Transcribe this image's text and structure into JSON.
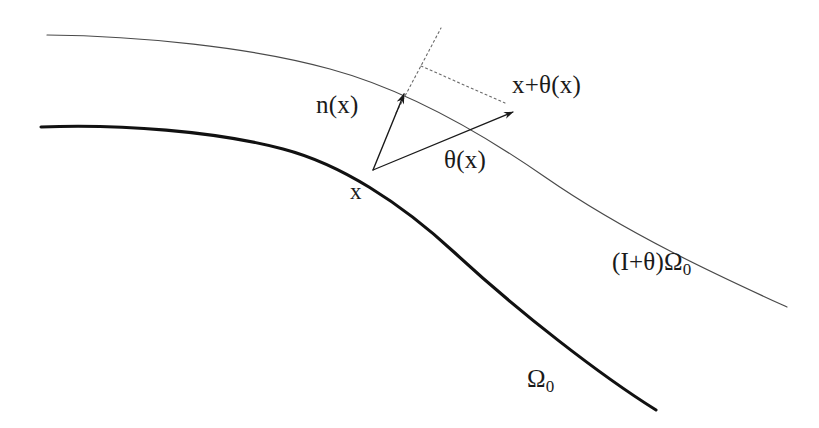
{
  "figure": {
    "background_color": "#ffffff",
    "width": 819,
    "height": 428,
    "ink_color": "#1a1a1a",
    "thin_curve_color": "#4a4a4a",
    "thick_curve_color": "#111111"
  },
  "labels": {
    "normal_vector": "n(x)",
    "displacement_vector": "θ(x)",
    "base_point": "x",
    "displaced_point": "x+θ(x)",
    "perturbed_domain_prefix": "(I+θ)Ω",
    "perturbed_domain_sub": "0",
    "reference_domain_prefix": "Ω",
    "reference_domain_sub": "0"
  },
  "geometry": {
    "reference_boundary": {
      "name": "Omega_0 boundary",
      "stroke_width": 3.1,
      "path": "M 41 127 C 120 124 215 131 283 149 C 340 164 400 202 455 253 C 520 313 600 375 656 410",
      "endpoints": [
        [
          41,
          127
        ],
        [
          656,
          410
        ]
      ]
    },
    "perturbed_boundary": {
      "name": "(I+theta)Omega_0 boundary",
      "stroke_width": 1.2,
      "path": "M 47 35 C 140 36 250 47 330 69 C 400 88 470 125 545 177 C 630 236 730 281 787 307",
      "endpoints": [
        [
          47,
          35
        ],
        [
          787,
          307
        ]
      ]
    },
    "normal_arrow": {
      "name": "n(x)",
      "from": [
        373,
        170
      ],
      "to": [
        404,
        94
      ],
      "stroke_width": 1.4
    },
    "normal_dotted_extension": {
      "name": "normal extension past boundary",
      "from": [
        396,
        113
      ],
      "to": [
        441,
        28
      ],
      "dash": "2,3"
    },
    "tangent_dotted_segment": {
      "name": "tangent dotted segment",
      "from": [
        421,
        66
      ],
      "to": [
        505,
        103
      ],
      "dash": "2,3"
    },
    "displacement_arrow": {
      "name": "theta(x)",
      "from": [
        373,
        170
      ],
      "to": [
        513,
        112
      ],
      "stroke_width": 1.2
    },
    "base_point_marker": [
      373,
      170
    ]
  }
}
